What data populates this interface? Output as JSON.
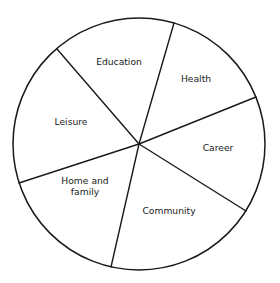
{
  "diagram": {
    "type": "wheel-of-life",
    "title": "",
    "shape": "circle",
    "background_color": "#ffffff",
    "stroke_color": "#1a1a1a",
    "text_color": "#1a1a1a",
    "circle": {
      "cx": 139,
      "cy": 144,
      "r": 126
    },
    "sector_count": 6,
    "sectors": [
      {
        "label": "Education",
        "start_angle_deg": -126,
        "end_angle_deg": -74,
        "label_x": 119,
        "label_y": 62
      },
      {
        "label": "Health",
        "start_angle_deg": -74,
        "end_angle_deg": -22,
        "label_x": 196,
        "label_y": 79
      },
      {
        "label": "Career",
        "start_angle_deg": -22,
        "end_angle_deg": 32,
        "label_x": 218,
        "label_y": 148
      },
      {
        "label": "Community",
        "start_angle_deg": 32,
        "end_angle_deg": 103,
        "label_x": 169,
        "label_y": 211
      },
      {
        "label": "Home and family",
        "line1": "Home and",
        "line2": "family",
        "start_angle_deg": 103,
        "end_angle_deg": 162,
        "label_x": 85,
        "label_y": 186
      },
      {
        "label": "Leisure",
        "start_angle_deg": 162,
        "end_angle_deg": 234,
        "label_x": 71,
        "label_y": 122
      }
    ],
    "spokes": [
      {
        "name": "education-health-divider",
        "x1": 139,
        "y1": 144,
        "x2": 174,
        "y2": 23
      },
      {
        "name": "health-career-divider",
        "x1": 139,
        "y1": 144,
        "x2": 256,
        "y2": 97
      },
      {
        "name": "career-community-divider",
        "x1": 139,
        "y1": 144,
        "x2": 246,
        "y2": 211
      },
      {
        "name": "community-home-divider",
        "x1": 139,
        "y1": 144,
        "x2": 111,
        "y2": 267
      },
      {
        "name": "home-leisure-divider",
        "x1": 139,
        "y1": 144,
        "x2": 19,
        "y2": 183
      },
      {
        "name": "leisure-education-divider",
        "x1": 139,
        "y1": 144,
        "x2": 57,
        "y2": 49
      }
    ]
  }
}
